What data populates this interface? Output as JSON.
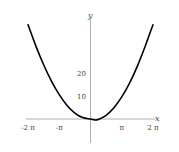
{
  "chart_data": {
    "type": "line",
    "title": "",
    "xlabel": "x",
    "ylabel": "y",
    "xlim": [
      -6.2832,
      6.2832
    ],
    "ylim": [
      -3,
      42
    ],
    "grid": false,
    "legend": null,
    "x_ticks": [
      {
        "value": -6.2832,
        "label": "-2 π"
      },
      {
        "value": -3.1416,
        "label": "-π"
      },
      {
        "value": 3.1416,
        "label": "π"
      },
      {
        "value": 6.2832,
        "label": "2 π"
      }
    ],
    "y_ticks": [
      {
        "value": 10,
        "label": "10"
      },
      {
        "value": 20,
        "label": "20"
      }
    ],
    "series": [
      {
        "name": "curve",
        "color": "#000000",
        "x": [
          -6.2832,
          -5.4978,
          -4.7124,
          -3.927,
          -3.1416,
          -2.3562,
          -1.5708,
          -0.7854,
          0,
          0.3927,
          0.7854,
          1.5708,
          2.3562,
          3.1416,
          3.927,
          4.7124,
          5.4978,
          6.2832
        ],
        "y": [
          41.0,
          31.8,
          23.6,
          16.5,
          10.6,
          5.9,
          2.6,
          0.6,
          0.0,
          -0.4,
          -0.2,
          1.6,
          4.9,
          9.6,
          15.6,
          23.0,
          31.6,
          41.0
        ]
      }
    ]
  },
  "axes": {
    "x_label": "x",
    "y_label": "y"
  }
}
